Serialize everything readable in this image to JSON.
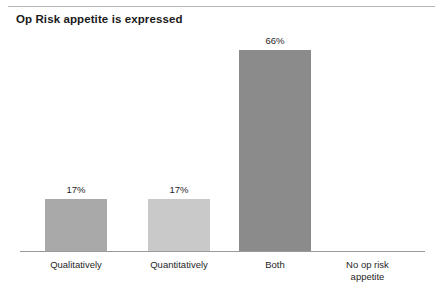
{
  "header": {
    "title": "Op Risk appetite is expressed"
  },
  "chart_data": {
    "type": "bar",
    "title": "Op Risk appetite is expressed",
    "xlabel": "",
    "ylabel": "",
    "ylim": [
      0,
      100
    ],
    "grid": false,
    "legend": false,
    "categories": [
      "Qualitatively",
      "Quantitatively",
      "Both",
      "No op risk\nappetite"
    ],
    "values": [
      17,
      17,
      66,
      0
    ],
    "value_labels": [
      "17%",
      "17%",
      "66%",
      ""
    ],
    "bar_colors": [
      "#a9a9a9",
      "#c9c9c9",
      "#8b8b8b",
      "#ffffff"
    ]
  },
  "style": {
    "background": "#ffffff",
    "axis_color": "#9a9a9a",
    "rule_color": "#b5b5b5",
    "text_color": "#1f1f1f",
    "title_color": "#1a1a1a"
  },
  "layout": {
    "bars": [
      {
        "left": 45,
        "width": 62,
        "height": 52,
        "label_left": 45,
        "label_width": 62
      },
      {
        "left": 148,
        "width": 62,
        "height": 52,
        "label_left": 148,
        "label_width": 62
      },
      {
        "left": 239,
        "width": 72,
        "height": 201,
        "label_left": 239,
        "label_width": 72
      },
      {
        "left": 352,
        "width": 0,
        "height": 0,
        "label_left": 330,
        "label_width": 75
      }
    ]
  }
}
